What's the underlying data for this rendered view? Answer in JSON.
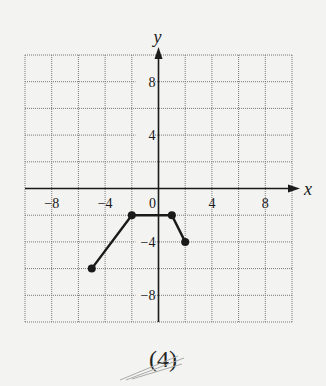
{
  "chart_data": {
    "type": "line",
    "title": "",
    "xlabel": "x",
    "ylabel": "y",
    "xlim": [
      -10,
      10
    ],
    "ylim": [
      -10,
      10
    ],
    "grid": true,
    "grid_step": 2,
    "x_ticks": [
      -8,
      -4,
      0,
      4,
      8
    ],
    "y_ticks": [
      8,
      4,
      -4,
      -8
    ],
    "x_tick_labels": [
      "−8",
      "−4",
      "0",
      "4",
      "8"
    ],
    "y_tick_labels": [
      "8",
      "4",
      "−4",
      "−8"
    ],
    "series": [
      {
        "name": "graph",
        "points": [
          [
            -5,
            -6
          ],
          [
            -2,
            -2
          ],
          [
            1,
            -2
          ],
          [
            2,
            -4
          ]
        ],
        "markers": "closed-dots"
      }
    ]
  },
  "labels": {
    "x_axis": "x",
    "y_axis": "y",
    "caption": "(4)"
  },
  "colors": {
    "background": "#f3f3f1",
    "ink": "#1a1a1a",
    "grid": "#777777"
  }
}
